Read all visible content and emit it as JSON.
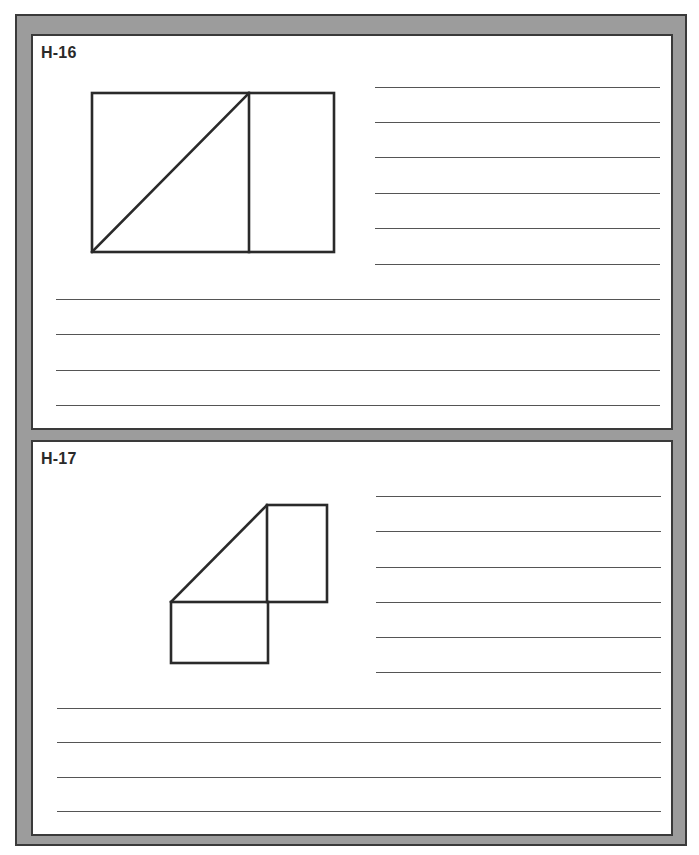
{
  "colors": {
    "frame": "#9c9c9c",
    "frame_edge": "#3a3a3a",
    "panel": "#ffffff",
    "ink": "#2a2a2a",
    "rule": "#555555"
  },
  "panels": [
    {
      "label": "H-16",
      "figure_description": "Rectangle split by a vertical line into a larger left section and smaller right section; the left section has a diagonal from bottom-left to top-right corner",
      "short_answer_lines": 6,
      "full_answer_lines": 4
    },
    {
      "label": "H-17",
      "figure_description": "Tall rectangle upper-right and a wide rectangle lower-left sharing a corner point, with a diagonal from the lower-left rectangle's top-left corner to the tall rectangle's top-left corner",
      "short_answer_lines": 6,
      "full_answer_lines": 4
    }
  ]
}
